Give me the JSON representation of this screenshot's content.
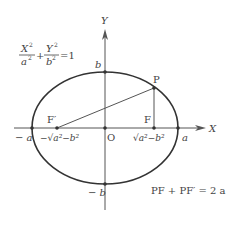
{
  "diagram": {
    "type": "ellipse-foci",
    "colors": {
      "curve": "#333333",
      "axis": "#555555",
      "text": "#444444",
      "background": "#ffffff"
    },
    "axes": {
      "x_label": "X",
      "y_label": "Y",
      "origin_label": "O"
    },
    "equation": {
      "num1": "X",
      "den1": "a",
      "num2": "Y",
      "den2": "b",
      "exp": "2",
      "plus": "+",
      "rhs": "=1"
    },
    "points": {
      "P": "P",
      "F": "F",
      "F_prime": "F′",
      "b": "b",
      "neg_b": "− b",
      "a": "a",
      "neg_a": "− a",
      "F_coord": "√a²−b²",
      "F_prime_coord": "−√a²−b²"
    },
    "relation": "PF + PF′ = 2 a"
  }
}
